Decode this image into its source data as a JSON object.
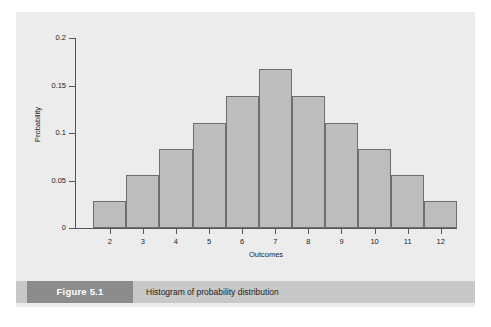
{
  "figure": {
    "badge_label": "Figure 5.1",
    "caption": "Histogram of probability distribution"
  },
  "colors": {
    "page_background": "#ffffff",
    "panel_background": "#ececec",
    "bar_fill": "#bdbdbd",
    "bar_stroke": "#6e6e6e",
    "axis": "#555555",
    "caption_bar": "#c8c8c8",
    "caption_badge": "#8c8c8c",
    "caption_badge_text": "#ffffff",
    "text": "#1c1c1c"
  },
  "chart_data": {
    "type": "bar",
    "title": "",
    "xlabel": "Outcomes",
    "ylabel": "Probability",
    "categories": [
      "2",
      "3",
      "4",
      "5",
      "6",
      "7",
      "8",
      "9",
      "10",
      "11",
      "12"
    ],
    "values": [
      0.028,
      0.056,
      0.083,
      0.111,
      0.139,
      0.167,
      0.139,
      0.111,
      0.083,
      0.056,
      0.028
    ],
    "ylim": [
      0,
      0.2
    ],
    "yticks": [
      0,
      0.05,
      0.1,
      0.15,
      0.2
    ],
    "ytick_labels": [
      "0",
      "0.05",
      "0.1",
      "0.15",
      "0.2"
    ],
    "xtick_labels": [
      "2",
      "3",
      "4",
      "5",
      "6",
      "7",
      "8",
      "9",
      "10",
      "11",
      "12"
    ],
    "grid": false,
    "legend": false
  }
}
